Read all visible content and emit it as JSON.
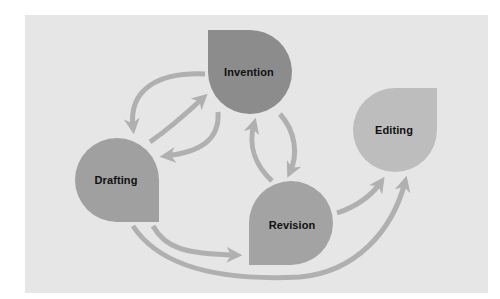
{
  "diagram": {
    "title": "",
    "colors": {
      "background": "#e6e6e6",
      "arrow": "#b0b0b0",
      "invention": "#8c8c8c",
      "drafting": "#a0a0a0",
      "revision": "#a3a3a3",
      "editing": "#bdbdbd",
      "label": "#111111"
    },
    "nodes": [
      {
        "id": "invention",
        "label": "Invention"
      },
      {
        "id": "drafting",
        "label": "Drafting"
      },
      {
        "id": "revision",
        "label": "Revision"
      },
      {
        "id": "editing",
        "label": "Editing"
      }
    ],
    "edges": [
      {
        "from": "invention",
        "to": "drafting"
      },
      {
        "from": "drafting",
        "to": "invention"
      },
      {
        "from": "invention",
        "to": "drafting"
      },
      {
        "from": "invention",
        "to": "revision"
      },
      {
        "from": "revision",
        "to": "invention"
      },
      {
        "from": "drafting",
        "to": "revision"
      },
      {
        "from": "revision",
        "to": "editing"
      },
      {
        "from": "drafting",
        "to": "editing"
      }
    ]
  }
}
